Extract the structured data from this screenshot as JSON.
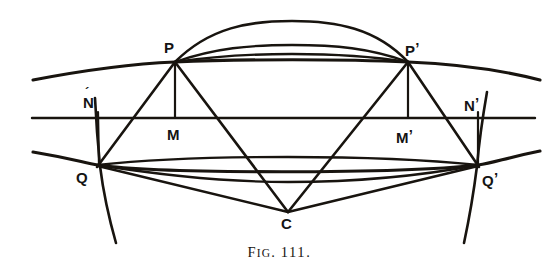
{
  "figure": {
    "caption_prefix": "F",
    "caption_prefix_rest": "IG",
    "caption_dot": ". ",
    "caption_number": "111.",
    "caption_full": "FIG. 111.",
    "background_color": "#ffffff",
    "ink_color": "#18140f"
  },
  "labels": {
    "p": "P",
    "p_prime_base": "P",
    "p_prime_mark": "’",
    "q": "Q",
    "q_prime_base": "Q",
    "q_prime_mark": "’",
    "m": "M",
    "m_prime_base": "M",
    "m_prime_mark": "’",
    "n": "N",
    "n_prime_base": "N",
    "n_prime_mark": "’",
    "c": "C"
  },
  "geometry": {
    "width": 559,
    "height": 276,
    "points": {
      "P": {
        "x": 175,
        "y": 62
      },
      "Pp": {
        "x": 408,
        "y": 62
      },
      "Q": {
        "x": 98,
        "y": 165
      },
      "Qp": {
        "x": 478,
        "y": 165
      },
      "M": {
        "x": 175,
        "y": 118
      },
      "Mp": {
        "x": 408,
        "y": 118
      },
      "N": {
        "x": 98,
        "y": 118
      },
      "Np": {
        "x": 478,
        "y": 118
      },
      "C": {
        "x": 288,
        "y": 212
      }
    },
    "axis": {
      "x1": 32,
      "y1": 118,
      "x2": 535,
      "y2": 118
    },
    "label_offsets": {
      "P": {
        "x": 164,
        "y": 40
      },
      "Pp": {
        "x": 405,
        "y": 40
      },
      "Q": {
        "x": 76,
        "y": 170
      },
      "Qp": {
        "x": 482,
        "y": 170
      },
      "M": {
        "x": 167,
        "y": 127
      },
      "Mp": {
        "x": 396,
        "y": 127
      },
      "N": {
        "x": 83,
        "y": 95
      },
      "Np": {
        "x": 464,
        "y": 95
      },
      "C": {
        "x": 281,
        "y": 216
      }
    }
  },
  "curves": {
    "top_outer_arc": "Top flattened arc peaking above P-P' chord",
    "upper_ellipse_arc": "Wide shallow arc passing through P and P' extending beyond both sides",
    "pp_chord": "Nearly straight chord from P to P'",
    "lower_ellipse_arc": "Wide shallow arc passing through Q and Q' extending beyond both sides",
    "qq_chord": "Slightly sagging chord from Q to Q'",
    "bottom_arc": "Lower arc dipping below the Q-Q' chord",
    "left_vertical_curve": "Near-vertical curve through N and Q continuing downward",
    "right_vertical_curve": "Near-vertical curve through N' and Q' continuing downward",
    "rays": [
      "P to C",
      "P' to C",
      "P to Q",
      "P' to Q'",
      "P to M (ordinate)",
      "P' to M' (ordinate)",
      "Q to C",
      "Q' to C"
    ]
  }
}
